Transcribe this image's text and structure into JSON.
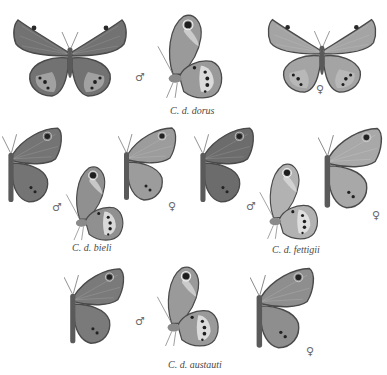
{
  "plate": {
    "background": "#ffffff",
    "groups": [
      {
        "caption": "C. d. dorus",
        "specimens": [
          {
            "view": "upperside",
            "sex": "male",
            "symbol": ""
          },
          {
            "view": "underside",
            "sex": "male",
            "symbol": "♂"
          },
          {
            "view": "upperside",
            "sex": "female",
            "symbol": "♀"
          }
        ]
      },
      {
        "caption": "C. d. bieli",
        "specimens": [
          {
            "view": "upperside",
            "sex": "male",
            "symbol": "♂"
          },
          {
            "view": "underside",
            "sex": "male",
            "symbol": ""
          },
          {
            "view": "upperside",
            "sex": "female",
            "symbol": "♀"
          }
        ]
      },
      {
        "caption": "C. d. fettigii",
        "specimens": [
          {
            "view": "upperside",
            "sex": "male",
            "symbol": "♂"
          },
          {
            "view": "underside",
            "sex": "male",
            "symbol": ""
          },
          {
            "view": "upperside",
            "sex": "female",
            "symbol": "♀"
          }
        ]
      },
      {
        "caption": "C. d. austauti",
        "specimens": [
          {
            "view": "upperside",
            "sex": "male",
            "symbol": ""
          },
          {
            "view": "underside",
            "sex": "male",
            "symbol": "♂"
          },
          {
            "view": "upperside",
            "sex": "female",
            "symbol": "♀"
          }
        ]
      }
    ]
  },
  "symbols": {
    "male": "♂",
    "female": "♀"
  },
  "colors": {
    "wing_dark": "#6e6e6e",
    "wing_mid": "#8c8c8c",
    "wing_light": "#b4b4b4",
    "wing_edge": "#4a4a4a",
    "band_light": "#e2e2e2",
    "eyespot": "#1e1e1e",
    "caption_text": "#4a4a4a"
  }
}
